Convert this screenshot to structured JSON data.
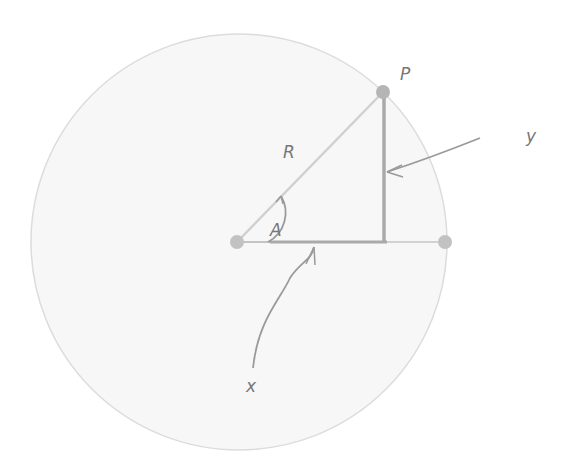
{
  "diagram": {
    "labels": {
      "point": "P",
      "radius": "R",
      "angle": "A",
      "x": "x",
      "y": "y"
    },
    "colors": {
      "circle_fill": "#f7f7f7",
      "circle_edge": "#d9d9d9",
      "radius_line": "#cfcfcf",
      "projection_line": "#a8a8a8",
      "point": "#bdbdbd",
      "arrow": "#9a9a9a",
      "text": "#777777"
    }
  }
}
